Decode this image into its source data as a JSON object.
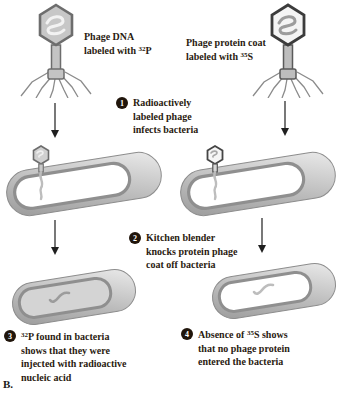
{
  "figure_label": "B.",
  "left_column": {
    "phage_caption": {
      "line1": "Phage DNA",
      "line2_prefix": "labeled with ",
      "isotope_mass": "32",
      "isotope_symbol": "P"
    }
  },
  "right_column": {
    "phage_caption": {
      "line1": "Phage protein coat",
      "line2_prefix": "labeled with ",
      "isotope_mass": "35",
      "isotope_symbol": "S"
    }
  },
  "steps": {
    "step1": {
      "number": "1",
      "lines": [
        "Radioactively",
        "labeled phage",
        "infects bacteria"
      ]
    },
    "step2": {
      "number": "2",
      "lines": [
        "Kitchen blender",
        "knocks protein phage",
        "coat off bacteria"
      ]
    },
    "step3": {
      "number": "3",
      "isotope_mass": "32",
      "isotope_symbol": "P",
      "line1_rest": " found in bacteria",
      "lines": [
        "shows that they were",
        "injected with radioactive",
        "nucleic acid"
      ]
    },
    "step4": {
      "number": "4",
      "line1_prefix": "Absence of ",
      "isotope_mass": "35",
      "isotope_symbol": "S",
      "line1_rest": " shows",
      "lines": [
        "that no phage protein",
        "entered the bacteria"
      ]
    }
  },
  "colors": {
    "background": "#ffffff",
    "text": "#2a1b10",
    "step_badge_background": "#20150b",
    "phage_head_dna_fill": "#c7c7c7",
    "phage_head_protein_fill": "#f4f4f4",
    "phage_outline_gray": "#6d6d6d",
    "phage_outline_dark": "#3c3c3c",
    "bacterium_body_gray": "#b5b5b5",
    "bacterium_interior_labeled": "#d4d4d4",
    "bacterium_interior_clear": "#ffffff",
    "dna_strand_gray": "#9c9c9c"
  }
}
